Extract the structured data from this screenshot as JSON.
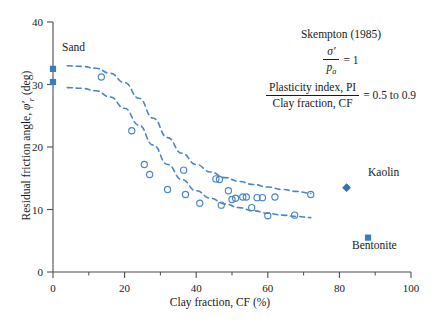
{
  "chart_data": {
    "type": "scatter",
    "title": "",
    "xlabel": "Clay fraction, CF (%)",
    "ylabel": "Residual friction angle, φ'r (deg)",
    "xlim": [
      0,
      100
    ],
    "ylim": [
      0,
      40
    ],
    "xticks": [
      0,
      20,
      40,
      60,
      80,
      100
    ],
    "xminorticks": [
      10,
      30,
      50,
      70,
      90
    ],
    "yticks": [
      0,
      10,
      20,
      30,
      40
    ],
    "grid": false,
    "legend": "none",
    "series": [
      {
        "name": "Sand (filled squares)",
        "marker": "filled-square",
        "color": "#3a7cc0",
        "points": [
          [
            0,
            32.5
          ],
          [
            0,
            30.4
          ]
        ]
      },
      {
        "name": "Residual friction data (open circles)",
        "marker": "open-circle",
        "color": "#4a86c5",
        "points": [
          [
            13.5,
            31.2
          ],
          [
            22.0,
            22.6
          ],
          [
            25.5,
            17.2
          ],
          [
            27.0,
            15.6
          ],
          [
            32.0,
            13.2
          ],
          [
            36.5,
            16.3
          ],
          [
            37.0,
            12.4
          ],
          [
            41.0,
            11.0
          ],
          [
            45.5,
            14.9
          ],
          [
            46.5,
            14.8
          ],
          [
            47.0,
            10.7
          ],
          [
            49.0,
            13.0
          ],
          [
            50.0,
            11.6
          ],
          [
            51.0,
            11.8
          ],
          [
            53.0,
            12.0
          ],
          [
            54.0,
            12.0
          ],
          [
            55.5,
            10.3
          ],
          [
            57.0,
            11.9
          ],
          [
            58.5,
            11.9
          ],
          [
            60.0,
            9.0
          ],
          [
            62.0,
            12.0
          ],
          [
            67.5,
            9.1
          ],
          [
            72.0,
            12.4
          ]
        ]
      },
      {
        "name": "Kaolin",
        "marker": "filled-diamond",
        "color": "#2f73b8",
        "points": [
          [
            82.0,
            13.5
          ]
        ]
      },
      {
        "name": "Bentonite",
        "marker": "filled-square",
        "color": "#3a7cc0",
        "points": [
          [
            88.0,
            5.5
          ]
        ]
      }
    ],
    "curves": [
      {
        "name": "upper-envelope",
        "style": "dashed",
        "color": "#4a86c5",
        "points": [
          [
            4,
            33.0
          ],
          [
            8,
            32.9
          ],
          [
            12,
            32.6
          ],
          [
            16,
            31.8
          ],
          [
            20,
            30.3
          ],
          [
            24,
            27.8
          ],
          [
            28,
            24.6
          ],
          [
            32,
            21.5
          ],
          [
            36,
            19.0
          ],
          [
            40,
            17.2
          ],
          [
            44,
            16.0
          ],
          [
            48,
            15.1
          ],
          [
            52,
            14.5
          ],
          [
            56,
            14.0
          ],
          [
            60,
            13.6
          ],
          [
            64,
            13.2
          ],
          [
            68,
            12.9
          ],
          [
            72,
            12.6
          ]
        ]
      },
      {
        "name": "lower-envelope",
        "style": "dashed",
        "color": "#4a86c5",
        "points": [
          [
            4,
            29.5
          ],
          [
            8,
            29.4
          ],
          [
            12,
            29.0
          ],
          [
            16,
            28.0
          ],
          [
            20,
            26.2
          ],
          [
            24,
            23.5
          ],
          [
            28,
            20.3
          ],
          [
            32,
            17.2
          ],
          [
            36,
            14.8
          ],
          [
            40,
            13.0
          ],
          [
            44,
            11.8
          ],
          [
            48,
            10.9
          ],
          [
            52,
            10.3
          ],
          [
            56,
            9.8
          ],
          [
            60,
            9.4
          ],
          [
            64,
            9.1
          ],
          [
            68,
            8.9
          ],
          [
            72,
            8.7
          ]
        ]
      }
    ],
    "annotations": {
      "sand": "Sand",
      "kaolin": "Kaolin",
      "bentonite": "Bentonite",
      "citation": "Skempton (1985)",
      "stress_ratio_num": "σ′",
      "stress_ratio_den": "p",
      "stress_ratio_den_sub": "a",
      "stress_ratio_value": "= 1",
      "pi_cf_num": "Plasticity index, PI",
      "pi_cf_den": "Clay fraction, CF",
      "pi_cf_value": "= 0.5 to 0.9"
    }
  }
}
